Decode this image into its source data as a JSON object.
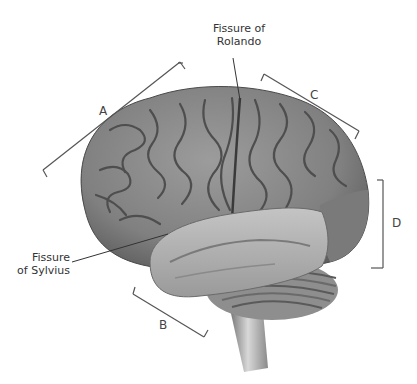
{
  "diagram": {
    "labels": {
      "rolando_line1": "Fissure of",
      "rolando_line2": "Rolando",
      "sylvius_line1": "Fissure",
      "sylvius_line2": "of Sylvius"
    },
    "brackets": {
      "A": "A",
      "B": "B",
      "C": "C",
      "D": "D"
    },
    "colors": {
      "cortex": "#8a8a8a",
      "cortex_dark": "#5a5a5a",
      "temporal_highlight": "#b8b8b8",
      "occipital": "#7e7e7e",
      "cerebellum": "#9a9a9a",
      "line": "#555555"
    }
  }
}
